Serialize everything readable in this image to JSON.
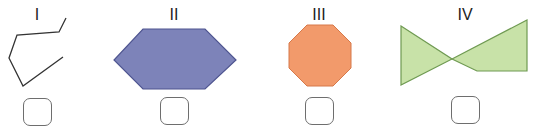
{
  "figures": [
    {
      "label": "I",
      "type": "open-polyline",
      "label_x": 37,
      "points": "66,18 59,32 17,35 9,58 23,86 63,57",
      "fill": "none",
      "stroke": "#333333",
      "answer_box": {
        "x": 23,
        "y": 98
      }
    },
    {
      "label": "II",
      "type": "hexagon",
      "label_x": 174,
      "points": "143,29 205,29 236,60 205,89 143,89 114,60",
      "fill": "#7d83b9",
      "stroke": "#4f5590",
      "answer_box": {
        "x": 160,
        "y": 97
      }
    },
    {
      "label": "III",
      "type": "octagon",
      "label_x": 319,
      "points": "307,25 333,25 351,43 351,68 333,86 307,86 289,68 289,43",
      "fill": "#f29a6b",
      "stroke": "#d6794a",
      "answer_box": {
        "x": 305,
        "y": 97
      }
    },
    {
      "label": "IV",
      "type": "bow-tie",
      "label_x": 465,
      "points": "401,26 452,59 401,85",
      "points_right": "452,59 527,20 527,71 477,71",
      "fill": "#c8e2a8",
      "stroke": "#6f9a52",
      "answer_box": {
        "x": 451,
        "y": 96
      }
    }
  ]
}
